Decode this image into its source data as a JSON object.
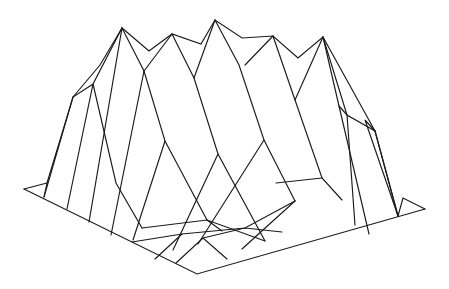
{
  "figure": {
    "type": "3d-wireframe-surface",
    "width": 449,
    "height": 289,
    "background": "#ffffff",
    "stroke_color": "#1a1a1a"
  },
  "base_outline": [
    [
      24,
      189
    ],
    [
      197,
      274
    ],
    [
      425,
      209
    ]
  ],
  "left_corner_flap": [
    [
      24,
      189
    ],
    [
      47,
      183
    ],
    [
      44,
      197
    ]
  ],
  "right_corner_flap": [
    [
      425,
      209
    ],
    [
      403,
      198
    ],
    [
      398,
      216
    ]
  ],
  "ridge": [
    [
      47,
      183
    ],
    [
      73,
      97
    ],
    [
      93,
      84
    ],
    [
      122,
      28
    ],
    [
      149,
      51
    ],
    [
      172,
      34
    ],
    [
      201,
      44
    ],
    [
      215,
      20
    ],
    [
      242,
      38
    ],
    [
      273,
      36
    ],
    [
      298,
      58
    ],
    [
      323,
      37
    ],
    [
      347,
      115
    ],
    [
      375,
      131
    ],
    [
      398,
      216
    ]
  ],
  "ridge_inner": [
    [
      73,
      97
    ],
    [
      100,
      65
    ],
    [
      122,
      28
    ]
  ],
  "ridge_right_inner": [
    [
      323,
      37
    ],
    [
      375,
      131
    ]
  ],
  "lines_to_base": [
    [
      [
        44,
        197
      ],
      [
        73,
        97
      ]
    ],
    [
      [
        67,
        209
      ],
      [
        93,
        84
      ],
      [
        116,
        183
      ],
      [
        142,
        228
      ]
    ],
    [
      [
        89,
        222
      ],
      [
        122,
        28
      ],
      [
        144,
        71
      ],
      [
        165,
        141
      ],
      [
        207,
        220
      ]
    ],
    [
      [
        111,
        235
      ],
      [
        144,
        71
      ]
    ],
    [
      [
        172,
        34
      ],
      [
        144,
        71
      ]
    ],
    [
      [
        172,
        34
      ],
      [
        194,
        78
      ],
      [
        218,
        154
      ],
      [
        265,
        241
      ]
    ],
    [
      [
        133,
        240
      ],
      [
        165,
        141
      ]
    ],
    [
      [
        215,
        20
      ],
      [
        194,
        78
      ]
    ],
    [
      [
        215,
        20
      ],
      [
        239,
        65
      ],
      [
        264,
        140
      ],
      [
        295,
        201
      ]
    ],
    [
      [
        173,
        250
      ],
      [
        218,
        154
      ]
    ],
    [
      [
        273,
        36
      ],
      [
        245,
        65
      ]
    ],
    [
      [
        273,
        36
      ],
      [
        295,
        100
      ],
      [
        322,
        178
      ],
      [
        342,
        200
      ]
    ],
    [
      [
        198,
        244
      ],
      [
        264,
        140
      ]
    ],
    [
      [
        323,
        37
      ],
      [
        295,
        100
      ]
    ],
    [
      [
        323,
        37
      ],
      [
        339,
        106
      ],
      [
        369,
        234
      ]
    ],
    [
      [
        276,
        183
      ],
      [
        322,
        178
      ]
    ],
    [
      [
        339,
        106
      ],
      [
        347,
        115
      ],
      [
        355,
        225
      ]
    ],
    [
      [
        375,
        131
      ],
      [
        398,
        216
      ]
    ],
    [
      [
        375,
        131
      ],
      [
        365,
        120
      ],
      [
        398,
        216
      ]
    ]
  ],
  "front_facets": [
    [
      [
        142,
        228
      ],
      [
        207,
        220
      ],
      [
        265,
        241
      ]
    ],
    [
      [
        132,
        242
      ],
      [
        182,
        234
      ],
      [
        245,
        228
      ],
      [
        295,
        201
      ]
    ],
    [
      [
        155,
        259
      ],
      [
        182,
        234
      ]
    ],
    [
      [
        176,
        263
      ],
      [
        203,
        238
      ],
      [
        227,
        259
      ]
    ],
    [
      [
        203,
        238
      ],
      [
        245,
        228
      ],
      [
        282,
        232
      ]
    ],
    [
      [
        242,
        249
      ],
      [
        295,
        201
      ]
    ],
    [
      [
        207,
        220
      ],
      [
        222,
        231
      ]
    ]
  ]
}
